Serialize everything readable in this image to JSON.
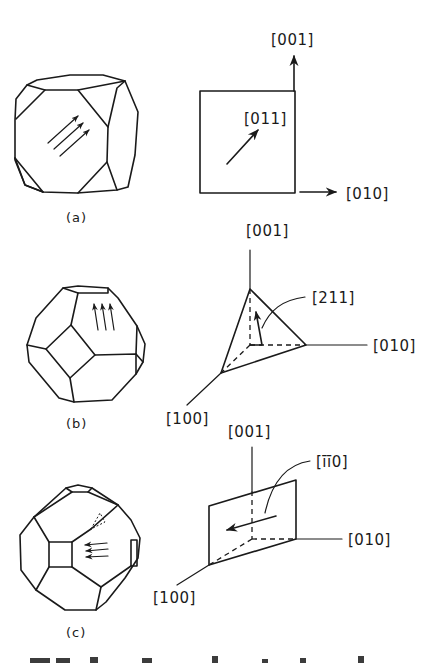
{
  "figure": {
    "background": "#ffffff",
    "line_color": "#1a1a1a",
    "panels": [
      {
        "id": "a",
        "caption": "(a)",
        "crystal": "truncated-cube",
        "slip_arrows": 3,
        "diagram": "square-plane",
        "labels": {
          "axis_up": "[001]",
          "axis_right": "[010]",
          "direction": "[011]"
        }
      },
      {
        "id": "b",
        "caption": "(b)",
        "crystal": "truncated-octahedron",
        "slip_arrows": 3,
        "diagram": "tetrahedral-plane",
        "labels": {
          "axis_up": "[001]",
          "axis_right": "[010]",
          "axis_left": "[100]",
          "direction": "[211]"
        }
      },
      {
        "id": "c",
        "caption": "(c)",
        "crystal": "truncated-octahedron",
        "slip_arrows": 3,
        "diagram": "inclined-plane",
        "labels": {
          "axis_up": "[001]",
          "axis_right": "[010]",
          "axis_left": "[100]",
          "direction": "[īī0]"
        }
      }
    ],
    "trailing_text": ""
  }
}
